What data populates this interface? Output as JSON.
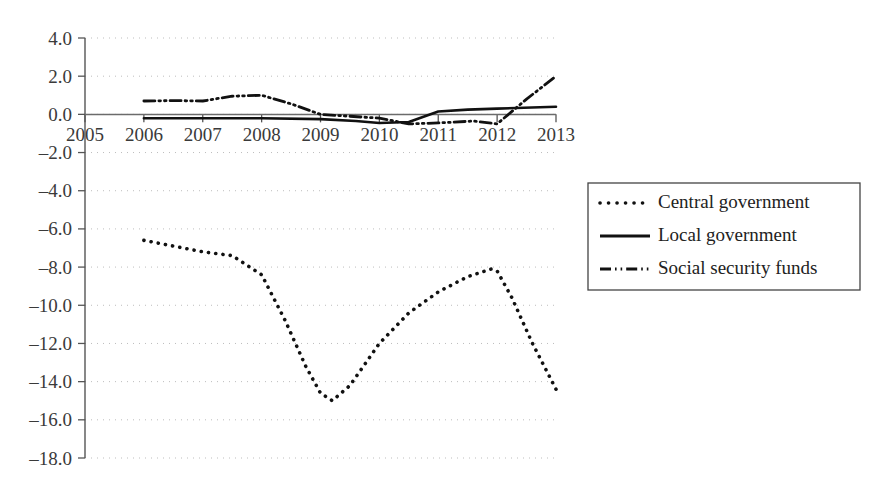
{
  "chart_data": {
    "type": "line",
    "title": "",
    "subtitle": "",
    "xlabel": "",
    "ylabel": "",
    "x": [
      2005,
      2006,
      2007,
      2008,
      2009,
      2010,
      2011,
      2012,
      2013
    ],
    "xtick_labels": [
      "2005",
      "2006",
      "2007",
      "2008",
      "2009",
      "2010",
      "2011",
      "2012",
      "2013"
    ],
    "ytick_labels": [
      "4.0",
      "2.0",
      "0.0",
      "–2.0",
      "–4.0",
      "–6.0",
      "–8.0",
      "–10.0",
      "–12.0",
      "–14.0",
      "–16.0",
      "–18.0"
    ],
    "ytick_values": [
      4.0,
      2.0,
      0.0,
      -2.0,
      -4.0,
      -6.0,
      -8.0,
      -10.0,
      -12.0,
      -14.0,
      -16.0,
      -18.0
    ],
    "ylim": [
      -18.0,
      4.0
    ],
    "xlim": [
      2005,
      2013
    ],
    "grid": true,
    "grid_style": "dotted-horizontal",
    "legend_position": "right",
    "series": [
      {
        "name": "Central government",
        "style": "dotted",
        "x": [
          2006.0,
          2006.5,
          2007.0,
          2007.5,
          2008.0,
          2008.4,
          2008.75,
          2009.0,
          2009.2,
          2009.5,
          2010.0,
          2010.5,
          2011.0,
          2011.5,
          2011.9,
          2012.0,
          2012.25,
          2012.6,
          2013.0
        ],
        "values": [
          -6.6,
          -6.9,
          -7.2,
          -7.4,
          -8.4,
          -10.8,
          -13.2,
          -14.6,
          -15.0,
          -14.2,
          -12.0,
          -10.4,
          -9.3,
          -8.5,
          -8.1,
          -8.2,
          -9.6,
          -12.0,
          -14.4
        ]
      },
      {
        "name": "Local government",
        "style": "solid",
        "x": [
          2006.0,
          2007.0,
          2008.0,
          2009.0,
          2009.6,
          2010.0,
          2010.5,
          2011.0,
          2011.5,
          2012.0,
          2013.0
        ],
        "values": [
          -0.2,
          -0.2,
          -0.2,
          -0.25,
          -0.35,
          -0.45,
          -0.4,
          0.15,
          0.25,
          0.3,
          0.4
        ]
      },
      {
        "name": "Social security funds",
        "style": "dash-dot-dot",
        "x": [
          2006.0,
          2006.5,
          2007.0,
          2007.5,
          2008.0,
          2008.5,
          2009.0,
          2009.5,
          2010.0,
          2010.5,
          2011.0,
          2011.6,
          2012.0,
          2012.5,
          2013.0
        ],
        "values": [
          0.7,
          0.72,
          0.7,
          0.95,
          1.0,
          0.55,
          0.0,
          -0.1,
          -0.2,
          -0.5,
          -0.45,
          -0.35,
          -0.5,
          0.8,
          2.0
        ]
      }
    ]
  },
  "legend": {
    "items": [
      {
        "label": "Central government",
        "style": "dotted"
      },
      {
        "label": "Local government",
        "style": "solid"
      },
      {
        "label": "Social security funds",
        "style": "dash-dot-dot"
      }
    ]
  },
  "colors": {
    "series": "#111111",
    "grid": "#bdbdbd",
    "axis": "#555555",
    "text": "#3a3a3a",
    "background": "#ffffff"
  }
}
